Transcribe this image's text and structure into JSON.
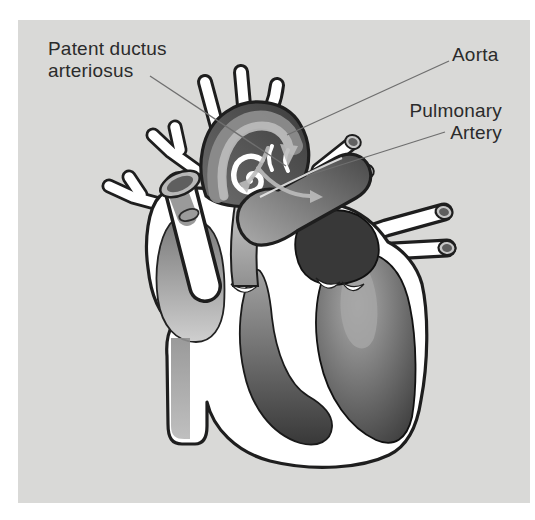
{
  "labels": {
    "patent_ductus": {
      "line1": "Patent ductus",
      "line2": "arteriosus"
    },
    "aorta": "Aorta",
    "pulmonary_artery": {
      "line1": "Pulmonary",
      "line2": "Artery"
    }
  },
  "palette": {
    "page_bg": "#ffffff",
    "panel_bg": "#d9d9d7",
    "outline": "#1e1e1e",
    "label_text": "#2b2b2b",
    "leader_line": "#6f6f6f",
    "vessel_dark": "#4a4a4a",
    "chamber_dark": "#383838",
    "heart_wall": "#ffffff",
    "flow_arrow": "#bcbcbc"
  }
}
